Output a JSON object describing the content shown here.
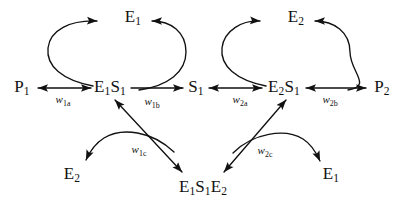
{
  "diagram": {
    "canvas": {
      "width": 412,
      "height": 207
    },
    "colors": {
      "stroke": "#111111",
      "text": "#111111",
      "background": "#ffffff"
    },
    "nodes": [
      {
        "id": "E1-top",
        "label": "E₁",
        "base": "E",
        "sub": "1",
        "x": 133,
        "y": 18
      },
      {
        "id": "E2-top",
        "label": "E₂",
        "base": "E",
        "sub": "2",
        "x": 296,
        "y": 18
      },
      {
        "id": "P1",
        "label": "P₁",
        "base": "P",
        "sub": "1",
        "x": 22,
        "y": 88
      },
      {
        "id": "E1S1",
        "label": "E₁S₁",
        "base": "E1S",
        "sub": "1",
        "x": 109,
        "y": 88
      },
      {
        "id": "S1",
        "label": "S₁",
        "base": "S",
        "sub": "1",
        "x": 196,
        "y": 88
      },
      {
        "id": "E2S1",
        "label": "E₂S₁",
        "base": "E2S",
        "sub": "1",
        "x": 283,
        "y": 88
      },
      {
        "id": "P2",
        "label": "P₂",
        "base": "P",
        "sub": "2",
        "x": 382,
        "y": 88
      },
      {
        "id": "E2-bottom",
        "label": "E₂",
        "base": "E",
        "sub": "2",
        "x": 72,
        "y": 175
      },
      {
        "id": "E1S1E2",
        "label": "E₁S₁E₂",
        "base": "E1S1E",
        "sub": "2",
        "x": 202,
        "y": 188
      },
      {
        "id": "E1-bottom",
        "label": "E₁",
        "base": "E",
        "sub": "1",
        "x": 331,
        "y": 175
      }
    ],
    "weights": [
      {
        "id": "w1a",
        "label": "w₁ₐ",
        "base": "w",
        "sub": "1a",
        "x": 63,
        "y": 101,
        "from": "P1",
        "to": "E1S1",
        "bidirectional": true
      },
      {
        "id": "w1b",
        "label": "w₁ᵇ",
        "base": "w",
        "sub": "1b",
        "x": 152,
        "y": 103,
        "from": "E1S1",
        "to": "S1",
        "bidirectional": false
      },
      {
        "id": "w2a",
        "label": "w₂ₐ",
        "base": "w",
        "sub": "2a",
        "x": 240,
        "y": 101,
        "from": "S1",
        "to": "E2S1",
        "bidirectional": true
      },
      {
        "id": "w2b",
        "label": "w₂ᵇ",
        "base": "w",
        "sub": "2b",
        "x": 330,
        "y": 101,
        "from": "E2S1",
        "to": "P2",
        "bidirectional": true
      },
      {
        "id": "w1c",
        "label": "w₁ᶜ",
        "base": "w",
        "sub": "1c",
        "x": 139,
        "y": 151,
        "from": "E1S1",
        "to": "E1S1E2",
        "bidirectional": true
      },
      {
        "id": "w2c",
        "label": "w₂ᶜ",
        "base": "w",
        "sub": "2c",
        "x": 265,
        "y": 152,
        "from": "E1S1E2",
        "to": "E2S1",
        "bidirectional": true
      }
    ],
    "arcs": [
      {
        "id": "arc-left-to-E1top",
        "from": "E1S1",
        "to": "E1-top",
        "direction": "counterclockwise"
      },
      {
        "id": "arc-right-to-E1top",
        "from": "S1",
        "to": "E1-top",
        "direction": "clockwise"
      },
      {
        "id": "arc-left-to-E2top",
        "from": "E2S1",
        "to": "E2-top",
        "direction": "counterclockwise"
      },
      {
        "id": "arc-right-to-E2top",
        "from": "P2",
        "to": "E2-top",
        "direction": "clockwise"
      },
      {
        "id": "arc-to-E2bottom",
        "from": "E1S1E2",
        "to": "E2-bottom",
        "direction": "arched"
      },
      {
        "id": "arc-to-E1bottom",
        "from": "E1S1E2",
        "to": "E1-bottom",
        "direction": "arched"
      }
    ]
  }
}
